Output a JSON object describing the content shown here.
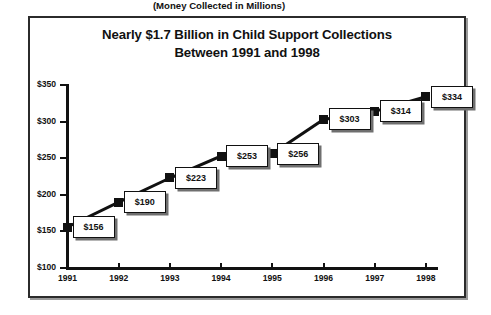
{
  "chart_data": {
    "type": "line",
    "title": "Nearly $1.7 Billion in Child Support Collections Between 1991 and 1998",
    "title_line_1": "Nearly $1.7 Billion in Child Support Collections",
    "title_line_2": "Between 1991 and 1998",
    "subtitle": "(Money Collected in Millions)",
    "xlabel": "",
    "ylabel": "",
    "categories": [
      "1991",
      "1992",
      "1993",
      "1994",
      "1995",
      "1996",
      "1997",
      "1998"
    ],
    "values": [
      156,
      190,
      223,
      253,
      256,
      303,
      314,
      334
    ],
    "point_labels": [
      "$156",
      "$190",
      "$223",
      "$253",
      "$256",
      "$303",
      "$314",
      "$334"
    ],
    "ylim": [
      100,
      350
    ],
    "ytick_values": [
      350,
      300,
      250,
      200,
      150,
      100
    ],
    "ytick_labels": [
      "$350",
      "$300",
      "$250",
      "$200",
      "$150",
      "$100"
    ],
    "grid": false,
    "legend": false,
    "series_color": "#111111",
    "marker_color": "#111111",
    "box_fill": "#ffffff",
    "box_border": "#111111"
  }
}
